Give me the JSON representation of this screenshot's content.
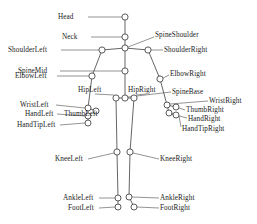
{
  "figure": {
    "width": 257,
    "height": 224,
    "background_color": "#ffffff",
    "line_color": "#555555",
    "joint_fill_color": "#ffffff",
    "joint_stroke_color": "#4a4a4a",
    "text_color": "#1a1a1a"
  },
  "joints": {
    "head": {
      "label": "Head",
      "x": 125,
      "y": 17,
      "r": 3.1
    },
    "neck": {
      "label": "Neck",
      "x": 125,
      "y": 37,
      "r": 3.1
    },
    "spine_shoulder": {
      "label": "SpineShoulder",
      "x": 125,
      "y": 48,
      "r": 3.1
    },
    "shoulder_left": {
      "label": "ShoulderLeft",
      "x": 102,
      "y": 50,
      "r": 3.1
    },
    "shoulder_right": {
      "label": "ShoulderRight",
      "x": 148,
      "y": 50,
      "r": 3.1
    },
    "spine_mid": {
      "label": "SpineMid",
      "x": 125,
      "y": 71,
      "r": 3.1
    },
    "elbow_left": {
      "label": "ElbowLeft",
      "x": 92,
      "y": 76,
      "r": 3.1
    },
    "elbow_right": {
      "label": "ElbowRight",
      "x": 160,
      "y": 79,
      "r": 3.1
    },
    "hip_left": {
      "label": "HipLeft",
      "x": 116,
      "y": 98,
      "r": 3.1
    },
    "spine_base": {
      "label": "SpineBase",
      "x": 125,
      "y": 98,
      "r": 3.1
    },
    "hip_right": {
      "label": "HipRight",
      "x": 134,
      "y": 98,
      "r": 3.1
    },
    "wrist_left": {
      "label": "WristLeft",
      "x": 88,
      "y": 108,
      "r": 3.0
    },
    "thumb_left": {
      "label": "ThumbLeft",
      "x": 96,
      "y": 111,
      "r": 3.0
    },
    "hand_left": {
      "label": "HandLeft",
      "x": 88,
      "y": 116,
      "r": 3.0
    },
    "hand_tip_left": {
      "label": "HandTipLeft",
      "x": 88,
      "y": 123,
      "r": 3.0
    },
    "wrist_right": {
      "label": "WristRight",
      "x": 167,
      "y": 105,
      "r": 3.0
    },
    "thumb_right": {
      "label": "ThumbRight",
      "x": 176,
      "y": 107,
      "r": 3.0
    },
    "hand_right": {
      "label": "HandRight",
      "x": 169,
      "y": 113,
      "r": 3.0
    },
    "hand_tip_right": {
      "label": "HandTipRight",
      "x": 176,
      "y": 115,
      "r": 3.0
    },
    "knee_left": {
      "label": "KneeLeft",
      "x": 117,
      "y": 152,
      "r": 3.1
    },
    "knee_right": {
      "label": "KneeRight",
      "x": 130,
      "y": 152,
      "r": 3.1
    },
    "ankle_left": {
      "label": "AnkleLeft",
      "x": 118,
      "y": 198,
      "r": 3.0
    },
    "ankle_right": {
      "label": "AnkleRight",
      "x": 129,
      "y": 197,
      "r": 3.0
    },
    "foot_left": {
      "label": "FootLeft",
      "x": 118,
      "y": 207,
      "r": 3.0
    },
    "foot_right": {
      "label": "FootRight",
      "x": 134,
      "y": 207,
      "r": 3.0
    }
  },
  "bones": [
    [
      "head",
      "neck"
    ],
    [
      "neck",
      "spine_shoulder"
    ],
    [
      "spine_shoulder",
      "shoulder_left"
    ],
    [
      "spine_shoulder",
      "shoulder_right"
    ],
    [
      "spine_shoulder",
      "spine_mid"
    ],
    [
      "spine_mid",
      "spine_base"
    ],
    [
      "shoulder_left",
      "elbow_left"
    ],
    [
      "shoulder_right",
      "elbow_right"
    ],
    [
      "elbow_left",
      "wrist_left"
    ],
    [
      "elbow_right",
      "wrist_right"
    ],
    [
      "wrist_left",
      "hand_left"
    ],
    [
      "wrist_left",
      "thumb_left"
    ],
    [
      "hand_left",
      "hand_tip_left"
    ],
    [
      "wrist_right",
      "hand_right"
    ],
    [
      "wrist_right",
      "thumb_right"
    ],
    [
      "hand_right",
      "hand_tip_right"
    ],
    [
      "spine_base",
      "hip_left"
    ],
    [
      "spine_base",
      "hip_right"
    ],
    [
      "hip_left",
      "knee_left"
    ],
    [
      "hip_right",
      "knee_right"
    ],
    [
      "knee_left",
      "ankle_left"
    ],
    [
      "knee_right",
      "ankle_right"
    ],
    [
      "ankle_left",
      "foot_left"
    ],
    [
      "ankle_right",
      "foot_right"
    ]
  ],
  "labels": [
    {
      "key": "head",
      "text": "Head",
      "side": "right",
      "tx": 58,
      "ty": 13,
      "lx1": 88,
      "ly1": 17,
      "lx2": 122,
      "ly2": 17
    },
    {
      "key": "neck",
      "text": "Neck",
      "side": "right",
      "tx": 62,
      "ty": 33,
      "lx1": 91,
      "ly1": 37,
      "lx2": 122,
      "ly2": 37
    },
    {
      "key": "spine_shoulder",
      "text": "SpineShoulder",
      "side": "left",
      "tx": 155,
      "ty": 31,
      "lx1": 128,
      "ly1": 47,
      "lx2": 154,
      "ly2": 37
    },
    {
      "key": "shoulder_left",
      "text": "ShoulderLeft",
      "side": "right",
      "tx": 8,
      "ty": 46,
      "lx1": 61,
      "ly1": 50,
      "lx2": 99,
      "ly2": 50
    },
    {
      "key": "shoulder_right",
      "text": "ShoulderRight",
      "side": "left",
      "tx": 164,
      "ty": 46,
      "lx1": 151,
      "ly1": 50,
      "lx2": 163,
      "ly2": 50
    },
    {
      "key": "spine_mid",
      "text": "SpineMid",
      "side": "right",
      "tx": 18,
      "ty": 67,
      "lx1": 60,
      "ly1": 71,
      "lx2": 122,
      "ly2": 71
    },
    {
      "key": "elbow_left",
      "text": "ElbowLeft",
      "side": "right",
      "tx": 15,
      "ty": 72,
      "lx1": 57,
      "ly1": 76,
      "lx2": 89,
      "ly2": 76
    },
    {
      "key": "elbow_right",
      "text": "ElbowRight",
      "side": "left",
      "tx": 170,
      "ty": 70,
      "lx1": 163,
      "ly1": 78,
      "lx2": 169,
      "ly2": 75
    },
    {
      "key": "hip_left",
      "text": "HipLeft",
      "side": "left",
      "tx": 78,
      "ty": 86,
      "lx1": 95,
      "ly1": 94,
      "lx2": 114,
      "ly2": 95
    },
    {
      "key": "hip_right",
      "text": "HipRight",
      "side": "left",
      "tx": 128,
      "ty": 86,
      "lx1": 146,
      "ly1": 94,
      "lx2": 136,
      "ly2": 95
    },
    {
      "key": "spine_base",
      "text": "SpineBase",
      "side": "left",
      "tx": 172,
      "ty": 88,
      "lx1": 171,
      "ly1": 92,
      "lx2": 128,
      "ly2": 97
    },
    {
      "key": "wrist_left",
      "text": "WristLeft",
      "side": "right",
      "tx": 20,
      "ty": 101,
      "lx1": 56,
      "ly1": 105,
      "lx2": 85,
      "ly2": 108
    },
    {
      "key": "thumb_left",
      "text": "ThumbLeft",
      "side": "left",
      "tx": 64,
      "ty": 110,
      "lx1": 99,
      "ly1": 111,
      "lx2": 99,
      "ly2": 111
    },
    {
      "key": "hand_left",
      "text": "HandLeft",
      "side": "right",
      "tx": 25,
      "ty": 110,
      "lx1": 57,
      "ly1": 114,
      "lx2": 85,
      "ly2": 116
    },
    {
      "key": "hand_tip_left",
      "text": "HandTipLeft",
      "side": "right",
      "tx": 17,
      "ty": 121,
      "lx1": 60,
      "ly1": 125,
      "lx2": 85,
      "ly2": 123
    },
    {
      "key": "wrist_right",
      "text": "WristRight",
      "side": "left",
      "tx": 209,
      "ty": 97,
      "lx1": 170,
      "ly1": 104,
      "lx2": 208,
      "ly2": 101
    },
    {
      "key": "thumb_right",
      "text": "ThumbRight",
      "side": "left",
      "tx": 186,
      "ty": 106,
      "lx1": 179,
      "ly1": 108,
      "lx2": 185,
      "ly2": 110
    },
    {
      "key": "hand_right",
      "text": "HandRight",
      "side": "left",
      "tx": 188,
      "ty": 115,
      "lx1": 172,
      "ly1": 114,
      "lx2": 187,
      "ly2": 118
    },
    {
      "key": "hand_tip_right",
      "text": "HandTipRight",
      "side": "left",
      "tx": 182,
      "ty": 125,
      "lx1": 179,
      "ly1": 116,
      "lx2": 181,
      "ly2": 127
    },
    {
      "key": "knee_left",
      "text": "KneeLeft",
      "side": "right",
      "tx": 55,
      "ty": 155,
      "lx1": 88,
      "ly1": 159,
      "lx2": 114,
      "ly2": 153
    },
    {
      "key": "knee_right",
      "text": "KneeRight",
      "side": "left",
      "tx": 160,
      "ty": 155,
      "lx1": 133,
      "ly1": 153,
      "lx2": 159,
      "ly2": 159
    },
    {
      "key": "ankle_left",
      "text": "AnkleLeft",
      "side": "right",
      "tx": 63,
      "ty": 194,
      "lx1": 99,
      "ly1": 198,
      "lx2": 115,
      "ly2": 198
    },
    {
      "key": "ankle_right",
      "text": "AnkleRight",
      "side": "left",
      "tx": 160,
      "ty": 194,
      "lx1": 132,
      "ly1": 197,
      "lx2": 159,
      "ly2": 198
    },
    {
      "key": "foot_left",
      "text": "FootLeft",
      "side": "right",
      "tx": 68,
      "ty": 204,
      "lx1": 99,
      "ly1": 208,
      "lx2": 115,
      "ly2": 207
    },
    {
      "key": "foot_right",
      "text": "FootRight",
      "side": "left",
      "tx": 160,
      "ty": 204,
      "lx1": 137,
      "ly1": 207,
      "lx2": 159,
      "ly2": 208
    }
  ]
}
